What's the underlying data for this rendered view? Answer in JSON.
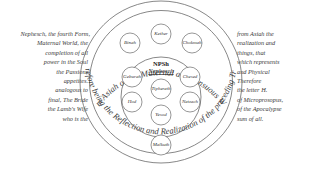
{
  "diagram": {
    "outer_ring": {
      "top_text": "From Asiah or the Maternal and Sensuous World",
      "bottom_text": "Therefore being the Reflection and Realization of the preceding Trinity"
    },
    "supernal_triad": [
      {
        "name": "Kether"
      },
      {
        "name": "Binah"
      },
      {
        "name": "Chokmah"
      }
    ],
    "center_circle": {
      "title": "NPSh",
      "subtitle": "Nephesch"
    },
    "inner_sephiroth": [
      {
        "name": "Geburah"
      },
      {
        "name": "Chesed"
      },
      {
        "name": "Tiphereth"
      },
      {
        "name": "Hod"
      },
      {
        "name": "Netzach"
      },
      {
        "name": "Yesod"
      }
    ],
    "bottom_node": {
      "name": "Malkuth"
    },
    "left_text": [
      "Nephesch, the fourth Form,",
      "Maternal World, the",
      "completion of all",
      "power in the Soul",
      "the Passions",
      "appetites.",
      "analogous to",
      "final, The Bride",
      "the Lamb's Wife",
      "who is the"
    ],
    "right_text": [
      "from Asiah the",
      "realization and",
      "things, that",
      "which represents",
      "and Physical",
      "Therefore",
      "the letter H.",
      "of Microprosopus,",
      "of the Apocalypse",
      "sum of all."
    ],
    "colors": {
      "line": "#6a6a6a",
      "text": "#3a3a3a",
      "background": "#ffffff"
    }
  }
}
